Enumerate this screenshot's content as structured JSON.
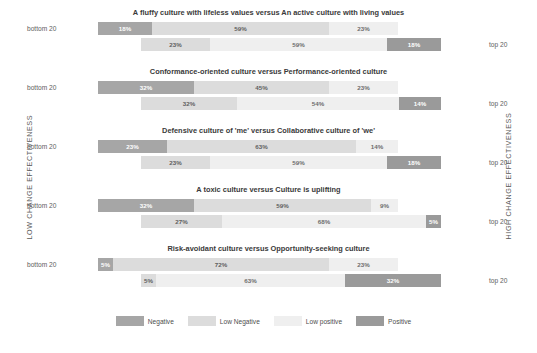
{
  "axis": {
    "left_label": "LOW CHANGE EFFECTIVENESS",
    "right_label": "HIGH CHANGE EFFECTIVENESS",
    "bottom_group_label": "bottom 20",
    "top_group_label": "top 20"
  },
  "legend": {
    "items": [
      {
        "label": "Negative",
        "color": "#a6a6a6",
        "key": "neg"
      },
      {
        "label": "Low Negative",
        "color": "#dcdcdc",
        "key": "lowneg"
      },
      {
        "label": "Low positive",
        "color": "#efefef",
        "key": "lowpos"
      },
      {
        "label": "Positive",
        "color": "#9a9a9a",
        "key": "pos"
      }
    ]
  },
  "chart_data": {
    "type": "bar",
    "subtype": "diverging-stacked-bar",
    "title": "",
    "xlabel": "",
    "ylabel": "",
    "categories": [
      "A fluffy culture with lifeless values versus An active culture with living values",
      "Conformance-oriented culture versus Performance-oriented culture",
      "Defensive culture of 'me' versus Collaborative culture of 'we'",
      "A toxic culture versus Culture is uplifting",
      "Risk-avoidant culture versus Opportunity-seeking culture"
    ],
    "series_keys": [
      "Negative",
      "Low Negative",
      "Low positive",
      "Positive"
    ],
    "rows": [
      {
        "title": "A fluffy culture with lifeless values versus An active culture with living values",
        "bottom": {
          "label": "bottom 20",
          "values": [
            18,
            59,
            23,
            0
          ],
          "labels": [
            "18%",
            "59%",
            "23%",
            ""
          ]
        },
        "top": {
          "label": "top 20",
          "values": [
            0,
            23,
            59,
            18
          ],
          "labels": [
            "",
            "23%",
            "59%",
            "18%"
          ]
        }
      },
      {
        "title": "Conformance-oriented culture versus Performance-oriented culture",
        "bottom": {
          "label": "bottom 20",
          "values": [
            32,
            45,
            23,
            0
          ],
          "labels": [
            "32%",
            "45%",
            "23%",
            ""
          ]
        },
        "top": {
          "label": "top 20",
          "values": [
            0,
            32,
            54,
            14
          ],
          "labels": [
            "",
            "32%",
            "54%",
            "14%"
          ]
        }
      },
      {
        "title": "Defensive culture of 'me' versus Collaborative culture of 'we'",
        "bottom": {
          "label": "bottom 20",
          "values": [
            23,
            63,
            14,
            0
          ],
          "labels": [
            "23%",
            "63%",
            "14%",
            ""
          ]
        },
        "top": {
          "label": "top 20",
          "values": [
            0,
            23,
            59,
            18
          ],
          "labels": [
            "",
            "23%",
            "59%",
            "18%"
          ]
        }
      },
      {
        "title": "A toxic culture versus Culture is uplifting",
        "bottom": {
          "label": "bottom 20",
          "values": [
            32,
            59,
            9,
            0
          ],
          "labels": [
            "32%",
            "59%",
            "9%",
            ""
          ]
        },
        "top": {
          "label": "top 20",
          "values": [
            0,
            27,
            68,
            5
          ],
          "labels": [
            "",
            "27%",
            "68%",
            "5%"
          ]
        }
      },
      {
        "title": "Risk-avoidant culture versus Opportunity-seeking culture",
        "bottom": {
          "label": "bottom 20",
          "values": [
            5,
            72,
            23,
            0
          ],
          "labels": [
            "5%",
            "72%",
            "23%",
            ""
          ]
        },
        "top": {
          "label": "top 20",
          "values": [
            0,
            5,
            63,
            32
          ],
          "labels": [
            "",
            "5%",
            "63%",
            "32%"
          ]
        }
      }
    ]
  }
}
